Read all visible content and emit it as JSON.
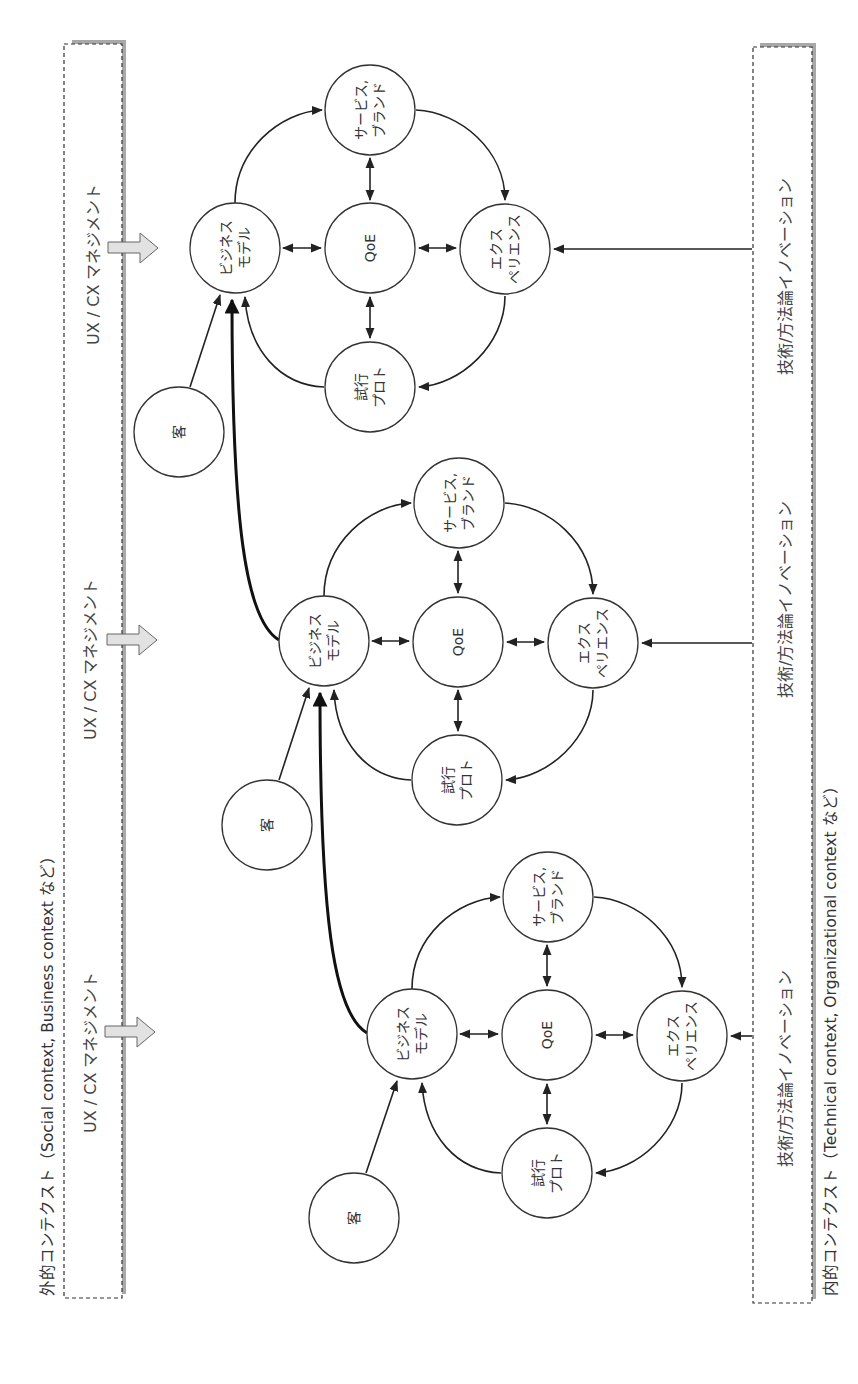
{
  "outer_context": {
    "label": "外的コンテクスト（Social context, Business context など）",
    "management_labels": [
      "UX / CX マネジメント",
      "UX / CX マネジメント",
      "UX / CX マネジメント"
    ]
  },
  "inner_context": {
    "label": "内的コンテクスト（Technical context, Organizational context など）",
    "innovation_labels": [
      "技術/方法論イノベーション",
      "技術/方法論イノベーション",
      "技術/方法論イノベーション"
    ]
  },
  "node_labels": {
    "customer": "客",
    "business_model": [
      "ビジネス",
      "モデル"
    ],
    "qoe": "QoE",
    "service_brand": [
      "サービス,",
      "ブランド"
    ],
    "experience": [
      "エクス",
      "ペリエンス"
    ],
    "trial_proto": [
      "試行",
      "プロト"
    ]
  },
  "clusters": [
    {
      "name": "cluster-1",
      "bm": [
        235,
        248
      ],
      "qoe": [
        370,
        248
      ],
      "svc": [
        370,
        110
      ],
      "exp": [
        505,
        249
      ],
      "trial": [
        370,
        387
      ],
      "cust": [
        179,
        432
      ]
    },
    {
      "name": "cluster-2",
      "bm": [
        324,
        641
      ],
      "qoe": [
        458,
        642
      ],
      "svc": [
        459,
        503
      ],
      "exp": [
        593,
        643
      ],
      "trial": [
        457,
        780
      ],
      "cust": [
        267,
        825
      ]
    },
    {
      "name": "cluster-3",
      "bm": [
        412,
        1034
      ],
      "qoe": [
        547,
        1035
      ],
      "svc": [
        548,
        897
      ],
      "exp": [
        682,
        1036
      ],
      "trial": [
        547,
        1173
      ],
      "cust": [
        354,
        1218
      ]
    }
  ],
  "colors": {
    "stroke": "#333333",
    "block_arrow_fill": "#e2e2e2",
    "box_shadow": "#a8a8a8"
  }
}
